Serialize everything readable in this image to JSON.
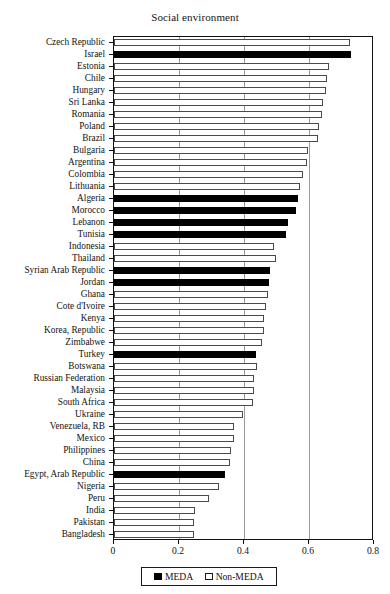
{
  "chart": {
    "title": "Social environment",
    "xlabel": "",
    "ylabel": ""
  },
  "legend": {
    "items": [
      {
        "label": "MEDA",
        "swatch": "filled-square-icon",
        "color": "#000000"
      },
      {
        "label": "Non-MEDA",
        "swatch": "open-square-icon",
        "color": "#ffffff"
      }
    ]
  },
  "axis": {
    "xticks": [
      "0",
      "0.2",
      "0.4",
      "0.6",
      "0.8"
    ],
    "xtickvalues": [
      0,
      0.2,
      0.4,
      0.6,
      0.8
    ]
  },
  "chart_data": {
    "type": "bar",
    "orientation": "horizontal",
    "title": "Social environment",
    "xlabel": "",
    "ylabel": "",
    "xlim": [
      0,
      0.8
    ],
    "grid": true,
    "legend_position": "bottom",
    "legend": [
      "MEDA",
      "Non-MEDA"
    ],
    "group_colors": {
      "MEDA": "#000000",
      "Non-MEDA": "#ffffff"
    },
    "categories": [
      "Czech Republic",
      "Israel",
      "Estonia",
      "Chile",
      "Hungary",
      "Sri Lanka",
      "Romania",
      "Poland",
      "Brazil",
      "Bulgaria",
      "Argentina",
      "Colombia",
      "Lithuania",
      "Algeria",
      "Morocco",
      "Lebanon",
      "Tunisia",
      "Indonesia",
      "Thailand",
      "Syrian Arab Republic",
      "Jordan",
      "Ghana",
      "Cote d'Ivoire",
      "Kenya",
      "Korea, Republic",
      "Zimbabwe",
      "Turkey",
      "Botswana",
      "Russian Federation",
      "Malaysia",
      "South Africa",
      "Ukraine",
      "Venezuela, RB",
      "Mexico",
      "Philippines",
      "China",
      "Egypt, Arab Republic",
      "Nigeria",
      "Peru",
      "India",
      "Pakistan",
      "Bangladesh"
    ],
    "values": [
      0.726,
      0.73,
      0.662,
      0.655,
      0.652,
      0.643,
      0.64,
      0.63,
      0.627,
      0.597,
      0.594,
      0.58,
      0.572,
      0.566,
      0.56,
      0.535,
      0.53,
      0.492,
      0.498,
      0.48,
      0.477,
      0.474,
      0.468,
      0.462,
      0.462,
      0.455,
      0.437,
      0.44,
      0.43,
      0.43,
      0.427,
      0.397,
      0.37,
      0.368,
      0.36,
      0.357,
      0.342,
      0.323,
      0.292,
      0.249,
      0.246,
      0.246
    ],
    "groups": [
      "Non-MEDA",
      "MEDA",
      "Non-MEDA",
      "Non-MEDA",
      "Non-MEDA",
      "Non-MEDA",
      "Non-MEDA",
      "Non-MEDA",
      "Non-MEDA",
      "Non-MEDA",
      "Non-MEDA",
      "Non-MEDA",
      "Non-MEDA",
      "MEDA",
      "MEDA",
      "MEDA",
      "MEDA",
      "Non-MEDA",
      "Non-MEDA",
      "MEDA",
      "MEDA",
      "Non-MEDA",
      "Non-MEDA",
      "Non-MEDA",
      "Non-MEDA",
      "Non-MEDA",
      "MEDA",
      "Non-MEDA",
      "Non-MEDA",
      "Non-MEDA",
      "Non-MEDA",
      "Non-MEDA",
      "Non-MEDA",
      "Non-MEDA",
      "Non-MEDA",
      "Non-MEDA",
      "MEDA",
      "Non-MEDA",
      "Non-MEDA",
      "Non-MEDA",
      "Non-MEDA",
      "Non-MEDA"
    ]
  }
}
